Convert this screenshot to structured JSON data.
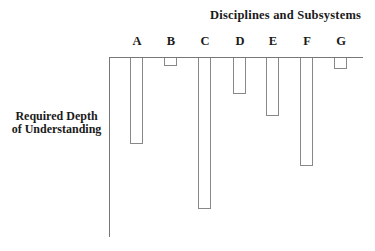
{
  "chart_data": {
    "type": "bar",
    "orientation": "downward-from-top-axis",
    "title": "Disciplines and Subsystems",
    "xlabel": "Disciplines and Subsystems",
    "ylabel": "Required Depth of Understanding",
    "categories": [
      "A",
      "B",
      "C",
      "D",
      "E",
      "F",
      "G"
    ],
    "values": [
      86,
      8,
      151,
      36,
      58,
      108,
      11
    ],
    "value_units": "relative depth (no numeric scale shown)",
    "ylim": [
      0,
      180
    ],
    "grid": false,
    "legend": null
  },
  "labels": {
    "title": "Disciplines and Subsystems",
    "ylabel_line1": "Required Depth",
    "ylabel_line2": "of Understanding"
  }
}
